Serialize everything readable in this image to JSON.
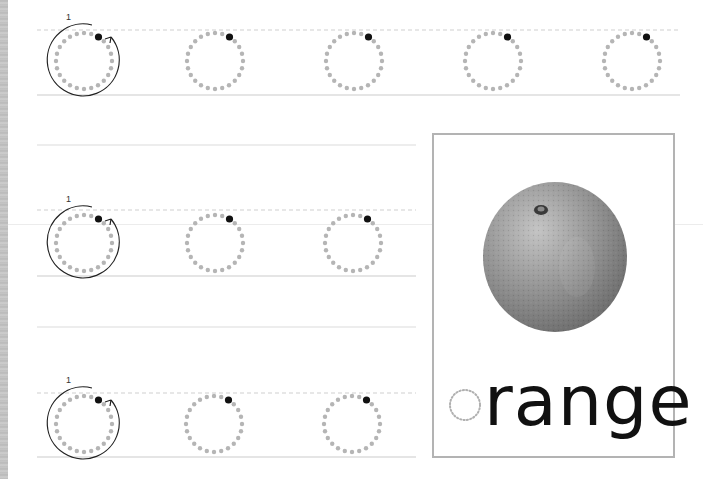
{
  "worksheet": {
    "letter": "o",
    "stroke_number": "1",
    "colors": {
      "guide_dot": "#b5b5b5",
      "start_dot": "#111111",
      "solid_line": "#dcdcdc",
      "dashed_line": "#cfcfcf",
      "card_border": "#b3b3b3",
      "arrow": "#222222"
    },
    "rows": [
      {
        "id": "row-1",
        "circles": 5,
        "has_demo_arrow": true
      },
      {
        "id": "row-2",
        "circles": 3,
        "has_demo_arrow": true
      },
      {
        "id": "row-3",
        "circles": 3,
        "has_demo_arrow": true
      }
    ]
  },
  "picture_card": {
    "image": "orange-fruit-photo",
    "word_first_letter": "o",
    "word_rest": "range",
    "word": "orange"
  }
}
